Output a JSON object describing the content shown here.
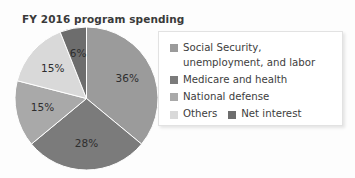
{
  "chart_data": {
    "type": "pie",
    "title": "FY 2016 program spending",
    "xlabel": "",
    "ylabel": "",
    "legend_position": "right",
    "grid": false,
    "categories": [
      "Social Security, unemployment, and labor",
      "Medicare and health",
      "National defense",
      "Others",
      "Net interest"
    ],
    "values": [
      36,
      28,
      15,
      15,
      6
    ],
    "value_labels": [
      "36%",
      "28%",
      "15%",
      "15%",
      "6%"
    ],
    "unit": "%",
    "colors": [
      "#9b9b9b",
      "#7b7b7b",
      "#a9a9a9",
      "#d9d9d9",
      "#6d6d6d"
    ],
    "start_angle_deg": 0,
    "direction": "clockwise"
  },
  "title": {
    "text": "FY 2016 program spending"
  },
  "pie": {
    "slices": [
      {
        "label": "Social Security, unemployment, and labor",
        "percent_label": "36%",
        "value": 36,
        "color": "#9b9b9b"
      },
      {
        "label": "Medicare and health",
        "percent_label": "28%",
        "value": 28,
        "color": "#7b7b7b"
      },
      {
        "label": "National defense",
        "percent_label": "15%",
        "value": 15,
        "color": "#a9a9a9"
      },
      {
        "label": "Others",
        "percent_label": "15%",
        "value": 15,
        "color": "#d9d9d9"
      },
      {
        "label": "Net interest",
        "percent_label": "6%",
        "value": 6,
        "color": "#6d6d6d"
      }
    ]
  },
  "legend": {
    "entries": [
      {
        "label": "Social Security, unemployment, and labor",
        "color": "#9b9b9b"
      },
      {
        "label": "Medicare and health",
        "color": "#7b7b7b"
      },
      {
        "label": "National defense",
        "color": "#a9a9a9"
      },
      {
        "label": "Others",
        "color": "#d9d9d9"
      },
      {
        "label": "Net interest",
        "color": "#6d6d6d"
      }
    ]
  }
}
